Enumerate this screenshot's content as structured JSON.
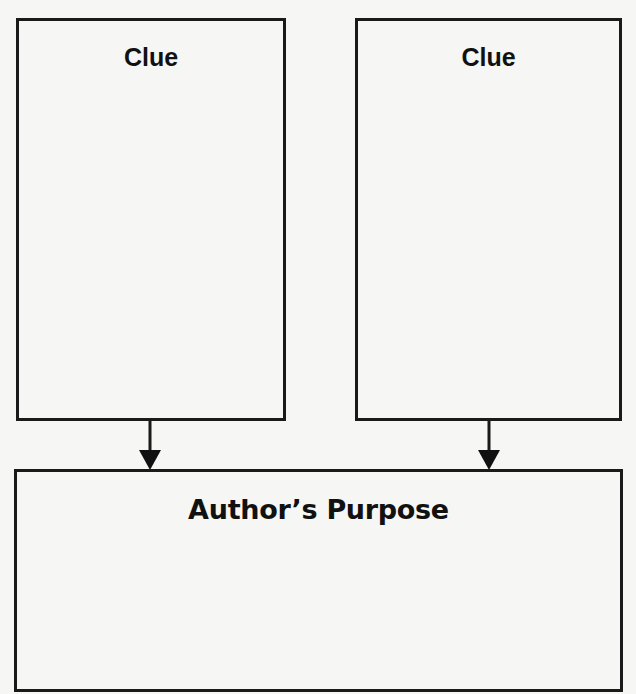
{
  "organizer": {
    "clue_boxes": [
      {
        "label": "Clue",
        "content": ""
      },
      {
        "label": "Clue",
        "content": ""
      }
    ],
    "purpose_box": {
      "label": "Author’s Purpose",
      "content": ""
    },
    "arrows": [
      {
        "from": "clue-1",
        "to": "author-purpose",
        "icon": "arrow-down-icon"
      },
      {
        "from": "clue-2",
        "to": "author-purpose",
        "icon": "arrow-down-icon"
      }
    ]
  },
  "colors": {
    "background": "#f6f6f4",
    "border": "#1a1a1a",
    "text": "#111111"
  }
}
